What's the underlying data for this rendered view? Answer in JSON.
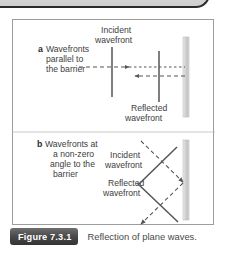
{
  "figure": {
    "badge": "Figure 7.3.1",
    "caption": "Reflection of plane waves.",
    "panel_a": {
      "marker": "a",
      "description_line1": "Wavefronts",
      "description_line2": "parallel to",
      "description_line3": "the barrier",
      "incident_label_line1": "Incident",
      "incident_label_line2": "wavefront",
      "reflected_label_line1": "Reflected",
      "reflected_label_line2": "wavefront"
    },
    "panel_b": {
      "marker": "b",
      "description_line1": "Wavefronts at",
      "description_line2": "a non-zero",
      "description_line3": "angle to the",
      "description_line4": "barrier",
      "incident_label_line1": "Incident",
      "incident_label_line2": "wavefront",
      "reflected_label_line1": "Reflected",
      "reflected_label_line2": "wavefront"
    },
    "colors": {
      "wavefront_line": "#555555",
      "ray_dashed": "#555555",
      "barrier": "#c9c9c9",
      "border": "#9d9d9d",
      "text": "#3d3d3d",
      "badge_background": "#3b3b3b"
    }
  }
}
